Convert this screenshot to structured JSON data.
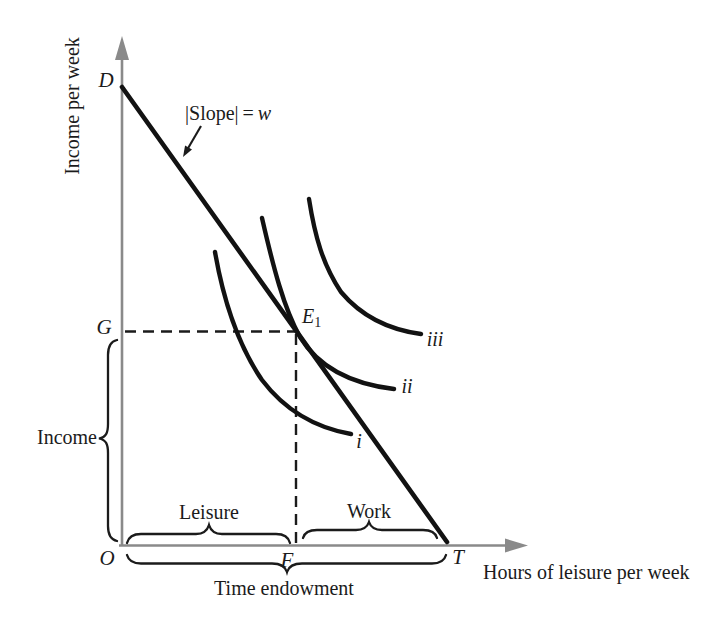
{
  "colors": {
    "background": "#ffffff",
    "ink": "#1b1b1b",
    "axis": "#8a8a8a",
    "line": "#121212"
  },
  "axes": {
    "y_label": "Income per week",
    "x_label": "Hours of leisure per week"
  },
  "points": {
    "d": "D",
    "g": "G",
    "o": "O",
    "f": "F",
    "t": "T",
    "e1_base": "E",
    "e1_sub": "1"
  },
  "curve_labels": {
    "i": "i",
    "ii": "ii",
    "iii": "iii"
  },
  "annotations": {
    "slope_prefix": "|Slope|",
    "slope_equals": "=",
    "slope_var": "w",
    "income": "Income",
    "leisure": "Leisure",
    "work": "Work",
    "time_endowment": "Time endowment"
  }
}
